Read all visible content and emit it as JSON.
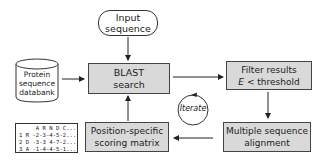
{
  "diagram": {
    "nodes": {
      "input": {
        "line1": "Input",
        "line2": "sequence",
        "shape": "rounded-rect"
      },
      "database": {
        "line1": "Protein",
        "line2": "sequence",
        "line3": "databank",
        "shape": "cylinder"
      },
      "blast": {
        "line1": "BLAST",
        "line2": "search",
        "shape": "rect",
        "fill": "#d9d9d9"
      },
      "filter": {
        "line1": "Filter results",
        "line2_var": "E",
        "line2_rest": " < threshold",
        "shape": "rect",
        "fill": "#d9d9d9"
      },
      "msa": {
        "line1": "Multiple sequence",
        "line2": "alignment",
        "shape": "rect",
        "fill": "#d9d9d9"
      },
      "pssm": {
        "line1": "Position-specific",
        "line2": "scoring matrix",
        "shape": "rect",
        "fill": "#d9d9d9"
      },
      "iterate": {
        "label": "Iterate",
        "shape": "circular-arrow"
      }
    },
    "matrix": {
      "header": "     A R N D C...",
      "rows": [
        "1 R -2-3-4-5-2...",
        "2 D -3-3 4-7-2...",
        "3 A -1-4-4-5-1..."
      ],
      "ellipsis": "..."
    },
    "edges": [
      {
        "from": "input",
        "to": "blast"
      },
      {
        "from": "database",
        "to": "blast"
      },
      {
        "from": "blast",
        "to": "filter"
      },
      {
        "from": "filter",
        "to": "msa"
      },
      {
        "from": "msa",
        "to": "pssm"
      },
      {
        "from": "pssm",
        "to": "blast"
      }
    ],
    "colors": {
      "box_fill": "#d9d9d9",
      "stroke": "#333333",
      "background": "#ffffff"
    }
  }
}
